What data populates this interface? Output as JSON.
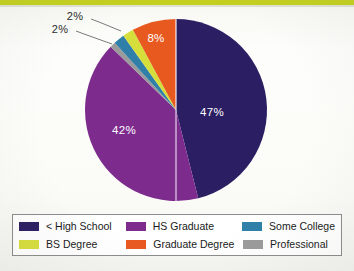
{
  "page": {
    "top_rule_color": "#c3d01f",
    "background_color": "#fbfbf8"
  },
  "chart_data": {
    "type": "pie",
    "title": "",
    "subtitle": "",
    "xlabel": "",
    "ylabel": "",
    "legend_position": "bottom",
    "grid": false,
    "start_angle_deg": 0,
    "direction": "counter-clockwise",
    "units": "percent",
    "categories": [
      "< High School",
      "HS Graduate",
      "Some College",
      "BS Degree",
      "Graduate Degree",
      "Professional"
    ],
    "values": [
      47,
      42,
      2,
      2,
      8,
      1
    ],
    "value_labels": [
      "47%",
      "42%",
      "2%",
      "2%",
      "8%",
      ""
    ],
    "colors": [
      "#2b1e63",
      "#7e2b8e",
      "#2f7fa8",
      "#d6de3c",
      "#e8591f",
      "#9b9b9b"
    ],
    "slices": [
      {
        "name": "< High School",
        "value": 47,
        "label": "47%",
        "color": "#2b1e63",
        "label_placement": "inside"
      },
      {
        "name": "HS Graduate",
        "value": 42,
        "label": "42%",
        "color": "#7e2b8e",
        "label_placement": "inside"
      },
      {
        "name": "Professional",
        "value": 1,
        "label": "",
        "color": "#9b9b9b",
        "label_placement": "none"
      },
      {
        "name": "Some College",
        "value": 2,
        "label": "2%",
        "color": "#2f7fa8",
        "label_placement": "callout"
      },
      {
        "name": "BS Degree",
        "value": 2,
        "label": "2%",
        "color": "#d6de3c",
        "label_placement": "callout"
      },
      {
        "name": "Graduate Degree",
        "value": 8,
        "label": "8%",
        "color": "#e8591f",
        "label_placement": "inside"
      }
    ],
    "annotations": [
      {
        "text": "2%",
        "points_to": "Some College"
      },
      {
        "text": "2%",
        "points_to": "BS Degree"
      }
    ]
  },
  "labels": {
    "hs_less": "47%",
    "hs_grad": "42%",
    "grad_degree": "8%",
    "some_college": "2%",
    "bs_degree": "2%"
  },
  "legend": {
    "rows": [
      [
        {
          "label": "< High School",
          "color": "#2b1e63"
        },
        {
          "label": "HS Graduate",
          "color": "#7e2b8e"
        },
        {
          "label": "Some College",
          "color": "#2f7fa8"
        }
      ],
      [
        {
          "label": "BS Degree",
          "color": "#d6de3c"
        },
        {
          "label": "Graduate Degree",
          "color": "#e8591f"
        },
        {
          "label": "Professional",
          "color": "#9b9b9b"
        }
      ]
    ]
  }
}
